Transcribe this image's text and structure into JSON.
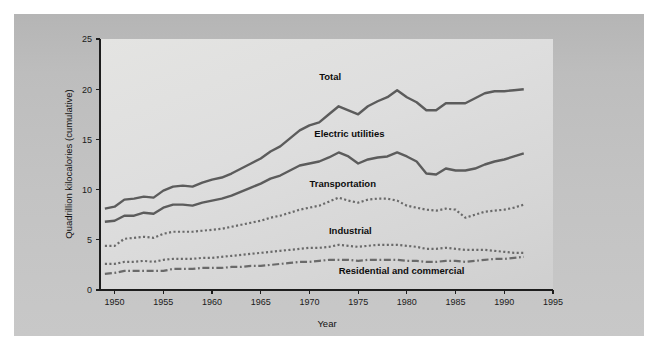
{
  "figure": {
    "panel_bg": "#c2c2c2",
    "plot_bg": "#ddddda",
    "axis_color": "#1d1d1d"
  },
  "chart_data": {
    "type": "line",
    "title": "",
    "subtitle": "",
    "xlabel": "Year",
    "ylabel": "Quadrillion kilocalories (cumulative)",
    "xlim": [
      1948.5,
      1995
    ],
    "ylim": [
      0,
      25
    ],
    "xticks": [
      1950,
      1955,
      1960,
      1965,
      1970,
      1975,
      1980,
      1985,
      1990,
      1995
    ],
    "yticks": [
      0,
      5,
      10,
      15,
      20,
      25
    ],
    "xtick_labels": [
      "1950",
      "1955",
      "1960",
      "1965",
      "1970",
      "1975",
      "1980",
      "1985",
      "1990",
      "1995"
    ],
    "ytick_labels": [
      "0",
      "5",
      "10",
      "15",
      "20",
      "25"
    ],
    "grid": false,
    "legend_position": "inline-annotations",
    "x": [
      1949,
      1950,
      1951,
      1952,
      1953,
      1954,
      1955,
      1956,
      1957,
      1958,
      1959,
      1960,
      1961,
      1962,
      1963,
      1964,
      1965,
      1966,
      1967,
      1968,
      1969,
      1970,
      1971,
      1972,
      1973,
      1974,
      1975,
      1976,
      1977,
      1978,
      1979,
      1980,
      1981,
      1982,
      1983,
      1984,
      1985,
      1986,
      1987,
      1988,
      1989,
      1990,
      1991,
      1992
    ],
    "series": [
      {
        "name": "Total",
        "style": "solid",
        "color": "#5c5c5c",
        "width": 2.4,
        "label_x": 1971.0,
        "label_y": 20.9,
        "values": [
          8.1,
          8.3,
          9.0,
          9.1,
          9.3,
          9.2,
          9.9,
          10.3,
          10.4,
          10.3,
          10.7,
          11.0,
          11.2,
          11.6,
          12.1,
          12.6,
          13.1,
          13.8,
          14.3,
          15.1,
          15.9,
          16.4,
          16.7,
          17.5,
          18.3,
          17.9,
          17.5,
          18.3,
          18.8,
          19.2,
          19.9,
          19.2,
          18.7,
          17.9,
          17.9,
          18.6,
          18.6,
          18.6,
          19.1,
          19.6,
          19.8,
          19.8,
          19.9,
          20.0
        ]
      },
      {
        "name": "Electric utilities",
        "style": "solid",
        "color": "#5c5c5c",
        "width": 2.4,
        "label_x": 1970.5,
        "label_y": 15.2,
        "values": [
          6.8,
          6.9,
          7.4,
          7.4,
          7.7,
          7.6,
          8.2,
          8.5,
          8.5,
          8.4,
          8.7,
          8.9,
          9.1,
          9.4,
          9.8,
          10.2,
          10.6,
          11.1,
          11.4,
          11.9,
          12.4,
          12.6,
          12.8,
          13.2,
          13.7,
          13.3,
          12.6,
          13.0,
          13.2,
          13.3,
          13.7,
          13.3,
          12.8,
          11.6,
          11.5,
          12.1,
          11.9,
          11.9,
          12.1,
          12.5,
          12.8,
          13.0,
          13.3,
          13.6
        ]
      },
      {
        "name": "Transportation",
        "style": "dotted",
        "color": "#6a6a6a",
        "width": 2.2,
        "label_x": 1970.0,
        "label_y": 10.3,
        "values": [
          4.4,
          4.4,
          5.1,
          5.2,
          5.3,
          5.2,
          5.6,
          5.8,
          5.8,
          5.8,
          5.9,
          6.0,
          6.1,
          6.3,
          6.5,
          6.7,
          6.9,
          7.2,
          7.4,
          7.7,
          8.0,
          8.2,
          8.4,
          8.8,
          9.2,
          8.9,
          8.7,
          9.0,
          9.1,
          9.1,
          8.9,
          8.4,
          8.2,
          8.0,
          7.9,
          8.1,
          8.0,
          7.2,
          7.5,
          7.8,
          7.9,
          8.0,
          8.2,
          8.5
        ]
      },
      {
        "name": "Industrial",
        "style": "dotted",
        "color": "#6a6a6a",
        "width": 2.2,
        "label_x": 1972.0,
        "label_y": 5.6,
        "values": [
          2.6,
          2.6,
          2.8,
          2.8,
          2.9,
          2.8,
          3.0,
          3.1,
          3.1,
          3.1,
          3.2,
          3.2,
          3.3,
          3.4,
          3.5,
          3.6,
          3.7,
          3.8,
          3.9,
          4.0,
          4.1,
          4.2,
          4.2,
          4.3,
          4.5,
          4.4,
          4.3,
          4.4,
          4.5,
          4.5,
          4.5,
          4.4,
          4.3,
          4.1,
          4.1,
          4.2,
          4.1,
          4.0,
          4.0,
          4.0,
          3.9,
          3.8,
          3.7,
          3.7
        ]
      },
      {
        "name": "Residential and commercial",
        "style": "dashdot",
        "color": "#6a6a6a",
        "width": 2.2,
        "label_x": 1973.0,
        "label_y": 1.6,
        "values": [
          1.6,
          1.7,
          1.9,
          1.9,
          1.9,
          1.9,
          1.9,
          2.1,
          2.1,
          2.1,
          2.2,
          2.2,
          2.2,
          2.3,
          2.3,
          2.4,
          2.4,
          2.5,
          2.6,
          2.7,
          2.8,
          2.8,
          2.9,
          3.0,
          3.0,
          3.0,
          2.9,
          3.0,
          3.0,
          3.0,
          3.0,
          2.9,
          2.9,
          2.8,
          2.8,
          2.9,
          2.9,
          2.8,
          2.9,
          3.0,
          3.1,
          3.1,
          3.2,
          3.3
        ]
      }
    ]
  }
}
